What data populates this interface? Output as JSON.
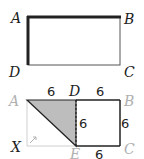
{
  "figure1": {
    "labels": {
      "A": "A",
      "B": "B",
      "C": "C",
      "D": "D"
    }
  },
  "figure2": {
    "labels": {
      "A": "A",
      "B": "B",
      "C": "C",
      "D": "D",
      "E": "E",
      "X": "X"
    },
    "measurements": {
      "AD": "6",
      "DB": "6",
      "DE": "6",
      "BC": "6",
      "EC": "6"
    },
    "colors": {
      "shaded": "#bdbdbd",
      "faded_label": "#b0b0b0",
      "ink": "#222222"
    }
  }
}
